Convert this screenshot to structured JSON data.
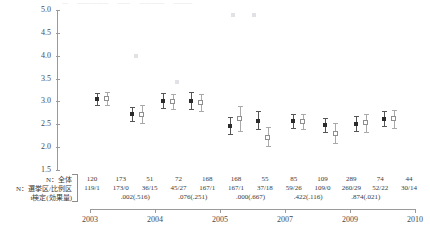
{
  "header_strip": [
    "—",
    "—————",
    "——",
    "————",
    "———"
  ],
  "axis": {
    "y_ticks": [
      "5.0",
      "4.5",
      "4.0",
      "3.5",
      "3.0",
      "2.5",
      "2.0",
      "1.5"
    ],
    "x_ticks": [
      "2003",
      "2004",
      "2005",
      "2007",
      "2009",
      "2010"
    ]
  },
  "row_labels": {
    "n_total": "N：全体",
    "n_split": "N：選挙区/比例区",
    "ttest": "t検定(効果量)"
  },
  "table": {
    "n_total": [
      "120",
      "173",
      "51",
      "72",
      "168",
      "168",
      "55",
      "85",
      "109",
      "289",
      "74",
      "44"
    ],
    "n_split": [
      "119/1",
      "173/0",
      "36/15",
      "45/27",
      "167/1",
      "167/1",
      "37/18",
      "59/26",
      "109/0",
      "260/29",
      "52/22",
      "30/14"
    ],
    "ttest": [
      ".002(.516)",
      ".076(.251)",
      ".000(.667)",
      ".422(.116)",
      ".874(.021)"
    ]
  },
  "chart_data": {
    "type": "scatter",
    "title": "",
    "xlabel": "",
    "ylabel": "",
    "ylim": [
      1.5,
      5.0
    ],
    "ygrid": false,
    "x_categories": [
      "2003",
      "2004",
      "2005",
      "2007",
      "2009",
      "2010"
    ],
    "series": [
      {
        "name": "選挙区",
        "marker": "filled",
        "points": [
          {
            "x": 0.05,
            "mean": 3.05,
            "low": 2.92,
            "high": 3.18
          },
          {
            "x": 0.3,
            "mean": 2.72,
            "low": 2.57,
            "high": 2.87
          },
          {
            "x": 0.52,
            "mean": 3.02,
            "low": 2.86,
            "high": 3.18
          },
          {
            "x": 0.72,
            "mean": 3.02,
            "low": 2.84,
            "high": 3.2
          },
          {
            "x": 1.0,
            "mean": 2.47,
            "low": 2.28,
            "high": 2.66
          },
          {
            "x": 1.2,
            "mean": 2.58,
            "low": 2.4,
            "high": 2.79
          },
          {
            "x": 1.45,
            "mean": 2.57,
            "low": 2.42,
            "high": 2.72
          },
          {
            "x": 1.68,
            "mean": 2.48,
            "low": 2.33,
            "high": 2.64
          },
          {
            "x": 1.9,
            "mean": 2.51,
            "low": 2.35,
            "high": 2.68
          },
          {
            "x": 2.1,
            "mean": 2.62,
            "low": 2.46,
            "high": 2.79
          }
        ]
      },
      {
        "name": "比例区",
        "marker": "open",
        "points": [
          {
            "x": 0.12,
            "mean": 3.07,
            "low": 2.93,
            "high": 3.21
          },
          {
            "x": 0.37,
            "mean": 2.72,
            "low": 2.52,
            "high": 2.93
          },
          {
            "x": 0.59,
            "mean": 3.0,
            "low": 2.84,
            "high": 3.17
          },
          {
            "x": 0.79,
            "mean": 2.98,
            "low": 2.8,
            "high": 3.16
          },
          {
            "x": 1.07,
            "mean": 2.62,
            "low": 2.36,
            "high": 2.9
          },
          {
            "x": 1.27,
            "mean": 2.22,
            "low": 2.02,
            "high": 2.44
          },
          {
            "x": 1.52,
            "mean": 2.56,
            "low": 2.4,
            "high": 2.73
          },
          {
            "x": 1.75,
            "mean": 2.3,
            "low": 2.08,
            "high": 2.52
          },
          {
            "x": 1.97,
            "mean": 2.53,
            "low": 2.33,
            "high": 2.72
          },
          {
            "x": 2.17,
            "mean": 2.62,
            "low": 2.42,
            "high": 2.82
          }
        ]
      },
      {
        "name": "outliers",
        "marker": "faint",
        "points": [
          {
            "x": 0.33,
            "mean": 4.0,
            "low": 4.0,
            "high": 4.0
          },
          {
            "x": 1.02,
            "mean": 4.88,
            "low": 4.88,
            "high": 4.88
          },
          {
            "x": 1.17,
            "mean": 4.88,
            "low": 4.88,
            "high": 4.88
          },
          {
            "x": 0.62,
            "mean": 3.42,
            "low": 3.42,
            "high": 3.42
          }
        ]
      }
    ]
  }
}
